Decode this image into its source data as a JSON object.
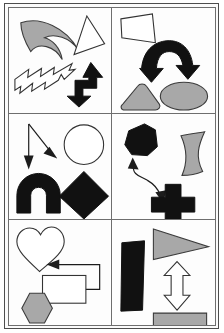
{
  "figure": {
    "title": "",
    "kind": "shape-panel-grid",
    "panel_count": 6,
    "columns": 2,
    "rows": 3,
    "colors": {
      "background": "#ffffff",
      "panel_fill": "#fdfdfd",
      "panel_border": "#6e6e6e",
      "outer_border": "#4d4d4d",
      "shape_black": "#111111",
      "shape_gray": "#a8a8a8",
      "shape_white": "#ffffff",
      "shape_outline": "#333333",
      "arrow_thin": "#1c1c1c"
    }
  },
  "panels": [
    {
      "id": "panel-top-left",
      "position": "top-left",
      "row": 1,
      "column": 1,
      "shapes": [
        {
          "name": "crescent-claw-shape",
          "fill": "gray",
          "style": "filled-outlined"
        },
        {
          "name": "triangle-shape",
          "fill": "white",
          "style": "outline"
        },
        {
          "name": "lightning-bolt-arrow-shape",
          "fill": "white",
          "style": "outline"
        },
        {
          "name": "bent-double-arrow-shape",
          "fill": "black",
          "style": "filled"
        }
      ]
    },
    {
      "id": "panel-top-right",
      "position": "top-right",
      "row": 1,
      "column": 2,
      "shapes": [
        {
          "name": "trapezoid-shape",
          "fill": "white",
          "style": "outline"
        },
        {
          "name": "curved-double-arrow-shape",
          "fill": "black",
          "style": "filled"
        },
        {
          "name": "rounded-triangle-shape",
          "fill": "gray",
          "style": "filled-outlined"
        },
        {
          "name": "ellipse-shape",
          "fill": "gray",
          "style": "filled-outlined"
        }
      ]
    },
    {
      "id": "panel-middle-left",
      "position": "middle-left",
      "row": 2,
      "column": 1,
      "shapes": [
        {
          "name": "down-arrow-line",
          "fill": "black",
          "style": "thin-line"
        },
        {
          "name": "diagonal-arrow-line",
          "fill": "black",
          "style": "thin-line"
        },
        {
          "name": "circle-shape",
          "fill": "white",
          "style": "outline"
        },
        {
          "name": "arch-horseshoe-shape",
          "fill": "black",
          "style": "filled"
        },
        {
          "name": "diamond-shape",
          "fill": "black",
          "style": "filled"
        }
      ]
    },
    {
      "id": "panel-middle-right",
      "position": "middle-right",
      "row": 2,
      "column": 2,
      "shapes": [
        {
          "name": "hexagon-blob-shape",
          "fill": "black",
          "style": "filled"
        },
        {
          "name": "wavy-ribbon-shape",
          "fill": "gray",
          "style": "filled-outlined"
        },
        {
          "name": "curved-double-arrow-connector",
          "fill": "black",
          "style": "thin-line"
        },
        {
          "name": "cross-plus-shape",
          "fill": "black",
          "style": "filled"
        }
      ]
    },
    {
      "id": "panel-bottom-left",
      "position": "bottom-left",
      "row": 3,
      "column": 1,
      "shapes": [
        {
          "name": "heart-shape",
          "fill": "white",
          "style": "outline"
        },
        {
          "name": "bracket-double-arrow-connector",
          "fill": "black",
          "style": "thin-line"
        },
        {
          "name": "rectangle-shape",
          "fill": "white",
          "style": "outline"
        },
        {
          "name": "hexagon-shape",
          "fill": "gray",
          "style": "filled-outlined"
        }
      ]
    },
    {
      "id": "panel-bottom-right",
      "position": "bottom-right",
      "row": 3,
      "column": 2,
      "shapes": [
        {
          "name": "vertical-bar-shape",
          "fill": "black",
          "style": "filled"
        },
        {
          "name": "right-triangle-wedge-shape",
          "fill": "gray",
          "style": "filled-outlined"
        },
        {
          "name": "vertical-double-arrow-shape",
          "fill": "white",
          "style": "outline"
        },
        {
          "name": "half-disc-shape",
          "fill": "gray",
          "style": "filled-outlined"
        }
      ]
    }
  ]
}
